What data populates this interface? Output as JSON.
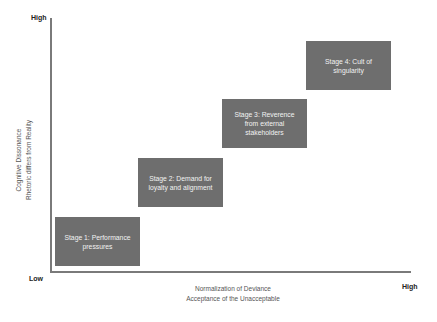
{
  "diagram": {
    "y_axis": {
      "high_label": "High",
      "low_label": "Low",
      "title_line1": "Cognitive Dissonance",
      "title_line2": "Rhetoric differs from Reality"
    },
    "x_axis": {
      "high_label": "High",
      "title_line1": "Normalization of Deviance",
      "title_line2": "Acceptance of the Unacceptable"
    },
    "stages": [
      {
        "label": "Stage 1: Performance pressures"
      },
      {
        "label": "Stage 2: Demand for loyalty and alignment"
      },
      {
        "label": "Stage 3: Reverence from external stakeholders"
      },
      {
        "label": "Stage 4: Cult of singularity"
      }
    ],
    "colors": {
      "box_fill": "#6e6e6e",
      "box_text": "#f2f2f2",
      "axis": "#7a7a7a"
    }
  }
}
